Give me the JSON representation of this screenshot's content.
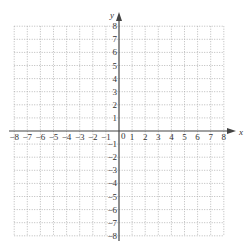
{
  "diagram": {
    "type": "coordinate-grid",
    "x_axis_label": "x",
    "y_axis_label": "y",
    "x_range": [
      -8,
      8
    ],
    "y_range": [
      -8,
      8
    ],
    "grid": "dotted, 1 unit spacing",
    "origin_label": "0",
    "x_ticks": [
      "-8",
      "-7",
      "-6",
      "-5",
      "-4",
      "-3",
      "-2",
      "-1",
      "1",
      "2",
      "3",
      "4",
      "5",
      "6",
      "7",
      "8"
    ],
    "y_ticks": [
      "8",
      "7",
      "6",
      "5",
      "4",
      "3",
      "2",
      "1",
      "-1",
      "-2",
      "-3",
      "-4",
      "-5",
      "-6",
      "-7",
      "-8"
    ],
    "colors": {
      "grid": "#aaaaaa",
      "axis": "#444444",
      "text": "#333333"
    }
  }
}
